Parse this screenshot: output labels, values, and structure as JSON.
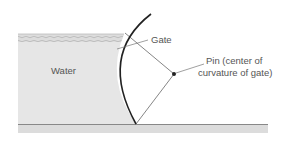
{
  "figure": {
    "labels": {
      "water": "Water",
      "gate": "Gate",
      "pin_line1": "Pin (center of",
      "pin_line2": "curvature of gate)"
    },
    "colors": {
      "water_fill": "#e6e6e6",
      "surface_hatch": "#bdbdbd",
      "gate_stroke": "#222222",
      "line_stroke": "#666666",
      "ground_line": "#888888",
      "ground_fill": "#dcdcdc",
      "text": "#555555"
    }
  }
}
